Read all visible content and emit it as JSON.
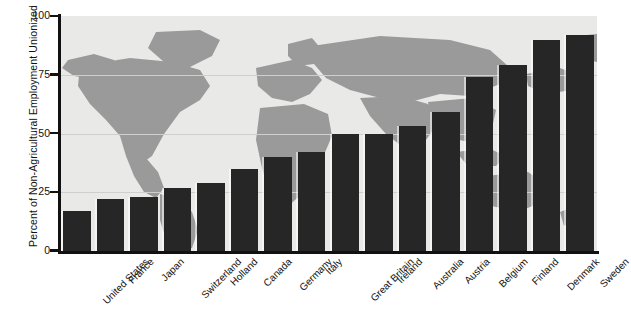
{
  "chart_data": {
    "type": "bar",
    "title": "",
    "xlabel": "",
    "ylabel": "Percent of Non-Agricultural Employment Unionized",
    "ylim": [
      0,
      100
    ],
    "yticks": [
      0,
      25,
      50,
      75,
      100
    ],
    "ytick_labels": [
      "0",
      "25",
      "50",
      "75",
      "100"
    ],
    "grid": true,
    "legend": "none",
    "background": "world-map",
    "bar_color": "#262626",
    "plot_bg_ocean": "#e9e9e7",
    "plot_bg_land": "#9a9a9a",
    "categories": [
      "United States",
      "France",
      "Japan",
      "Switzerland",
      "Holland",
      "Canada",
      "Germany",
      "Italy",
      "Great Britain",
      "Ireland",
      "Australia",
      "Austria",
      "Belgium",
      "Finland",
      "Denmark",
      "Sweden"
    ],
    "values": [
      17,
      22,
      23,
      27,
      29,
      35,
      40,
      42,
      50,
      50,
      53,
      59,
      74,
      79,
      90,
      92
    ]
  }
}
